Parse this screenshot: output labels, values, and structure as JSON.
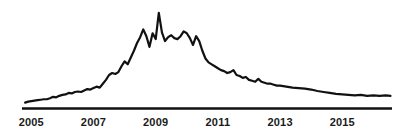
{
  "chart_data": {
    "type": "line",
    "title": "",
    "subtitle": "",
    "xlabel": "",
    "ylabel": "",
    "legend": [],
    "legend_position": "none",
    "grid": false,
    "axes": {
      "x_axis_visible": true,
      "y_axis_visible": false,
      "x_tick_marks": false
    },
    "xlim": [
      2004.7,
      2016.6
    ],
    "ylim": [
      0,
      100
    ],
    "tick_labels": [
      "2005",
      "2007",
      "2009",
      "2011",
      "2013",
      "2015"
    ],
    "tick_values": [
      2005,
      2007,
      2009,
      2011,
      2013,
      2015
    ],
    "line_color": "#111111",
    "line_width": 2.2,
    "background_color": "#ffffff",
    "axis_color": "#111111",
    "label_color": "#1a1a1a",
    "series": [
      {
        "name": "value",
        "x": [
          2004.8,
          2004.9,
          2005.0,
          2005.1,
          2005.2,
          2005.3,
          2005.4,
          2005.5,
          2005.6,
          2005.7,
          2005.8,
          2005.9,
          2006.0,
          2006.1,
          2006.2,
          2006.3,
          2006.4,
          2006.5,
          2006.6,
          2006.7,
          2006.8,
          2006.9,
          2007.0,
          2007.1,
          2007.2,
          2007.3,
          2007.4,
          2007.5,
          2007.6,
          2007.7,
          2007.8,
          2007.9,
          2008.0,
          2008.1,
          2008.2,
          2008.3,
          2008.4,
          2008.5,
          2008.6,
          2008.7,
          2008.8,
          2008.9,
          2009.0,
          2009.1,
          2009.2,
          2009.3,
          2009.4,
          2009.5,
          2009.6,
          2009.7,
          2009.8,
          2009.9,
          2010.0,
          2010.1,
          2010.2,
          2010.3,
          2010.4,
          2010.5,
          2010.6,
          2010.7,
          2010.8,
          2010.9,
          2011.0,
          2011.1,
          2011.2,
          2011.3,
          2011.4,
          2011.5,
          2011.6,
          2011.7,
          2011.8,
          2011.9,
          2012.0,
          2012.1,
          2012.2,
          2012.3,
          2012.4,
          2012.5,
          2012.6,
          2012.7,
          2012.8,
          2012.9,
          2013.0,
          2013.2,
          2013.4,
          2013.6,
          2013.8,
          2014.0,
          2014.2,
          2014.4,
          2014.6,
          2014.8,
          2015.0,
          2015.2,
          2015.4,
          2015.6,
          2015.8,
          2016.0,
          2016.2,
          2016.4,
          2016.55
        ],
        "y": [
          4.5,
          5.5,
          6.0,
          6.5,
          7.0,
          7.5,
          8.0,
          8.0,
          9.0,
          10.5,
          10.0,
          11.5,
          12.5,
          13.0,
          14.5,
          14.0,
          15.5,
          16.0,
          15.5,
          17.0,
          18.5,
          18.0,
          19.5,
          21.0,
          20.0,
          24.0,
          28.0,
          33.0,
          35.0,
          34.0,
          36.0,
          42.0,
          47.0,
          44.0,
          51.0,
          58.0,
          66.0,
          72.0,
          80.0,
          73.0,
          62.0,
          76.0,
          70.0,
          97.0,
          77.0,
          68.0,
          72.0,
          74.0,
          71.0,
          70.0,
          73.0,
          78.0,
          76.0,
          71.0,
          64.0,
          73.0,
          68.0,
          58.0,
          50.0,
          46.0,
          44.0,
          42.0,
          40.0,
          38.0,
          37.0,
          35.0,
          36.0,
          38.0,
          33.0,
          32.0,
          30.0,
          31.0,
          28.0,
          27.0,
          26.0,
          29.0,
          26.0,
          25.0,
          24.0,
          24.0,
          23.0,
          22.0,
          22.0,
          21.0,
          20.0,
          19.5,
          19.0,
          18.0,
          16.5,
          15.5,
          14.5,
          13.5,
          13.0,
          12.5,
          12.0,
          12.5,
          11.5,
          12.0,
          11.5,
          12.0,
          11.5
        ]
      }
    ]
  },
  "geometry": {
    "plot_left": 22,
    "plot_right": 392,
    "baseline_y": 107,
    "top_y": 10,
    "label_y": 116
  }
}
